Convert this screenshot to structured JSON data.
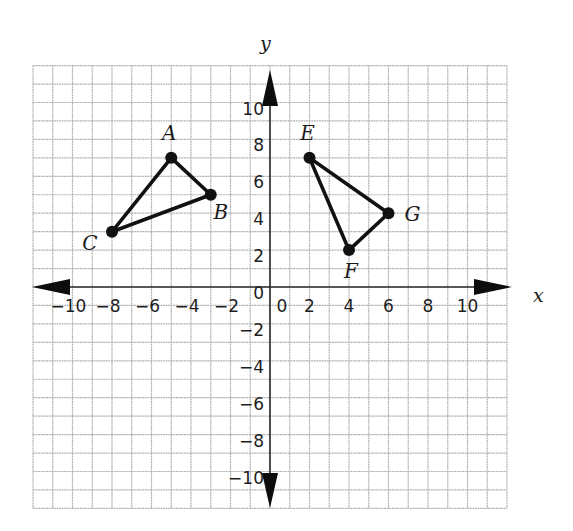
{
  "chart_data": {
    "type": "scatter",
    "title": "",
    "xlabel": "x",
    "ylabel": "y",
    "xlim": [
      -12,
      12
    ],
    "ylim": [
      -12,
      12
    ],
    "grid": true,
    "x_ticks": [
      -10,
      -8,
      -6,
      -4,
      -2,
      0,
      2,
      4,
      6,
      8,
      10
    ],
    "x_tick_labels": [
      "−10",
      "−8",
      "−6",
      "−4",
      "−2",
      "0",
      "2",
      "4",
      "6",
      "8",
      "10"
    ],
    "y_ticks": [
      10,
      8,
      6,
      4,
      2,
      0,
      -2,
      -4,
      -6,
      -8,
      -10
    ],
    "y_tick_labels": [
      "10",
      "8",
      "6",
      "4",
      "2",
      "0",
      "−2",
      "−4",
      "−6",
      "−8",
      "−10"
    ],
    "series": [
      {
        "name": "Triangle ABC",
        "points": [
          {
            "label": "A",
            "x": -5,
            "y": 7
          },
          {
            "label": "B",
            "x": -3,
            "y": 5
          },
          {
            "label": "C",
            "x": -8,
            "y": 3
          }
        ]
      },
      {
        "name": "Triangle EFG",
        "points": [
          {
            "label": "E",
            "x": 2,
            "y": 7
          },
          {
            "label": "F",
            "x": 4,
            "y": 2
          },
          {
            "label": "G",
            "x": 6,
            "y": 4
          }
        ]
      }
    ]
  },
  "colors": {
    "grid": "#b4b4b4",
    "axis": "#2a2a2a",
    "shape": "#111111"
  }
}
